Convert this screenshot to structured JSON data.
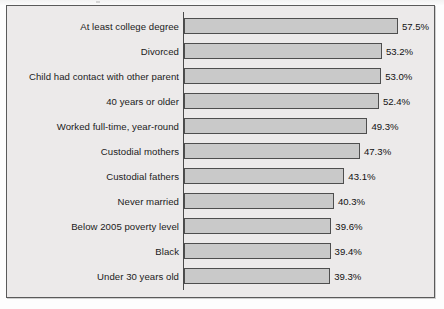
{
  "chart_data": {
    "type": "bar",
    "orientation": "horizontal",
    "title": "",
    "subtitle": "",
    "xlabel": "",
    "ylabel": "",
    "grid": false,
    "legend": false,
    "legend_position": "none",
    "xlim": [
      0,
      60
    ],
    "value_suffix": "%",
    "categories": [
      "At least college degree",
      "Divorced",
      "Child had contact with other parent",
      "40 years or older",
      "Worked full-time, year-round",
      "Custodial mothers",
      "Custodial fathers",
      "Never married",
      "Below 2005 poverty level",
      "Black",
      "Under 30 years old"
    ],
    "values": [
      57.5,
      53.2,
      53.0,
      52.4,
      49.3,
      47.3,
      43.1,
      40.3,
      39.6,
      39.4,
      39.3
    ],
    "value_labels": [
      "57.5%",
      "53.2%",
      "53.0%",
      "52.4%",
      "49.3%",
      "47.3%",
      "43.1%",
      "40.3%",
      "39.6%",
      "39.4%",
      "39.3%"
    ],
    "colors": {
      "bar_fill": "#c9c9c9",
      "bar_border": "#4e4e4e",
      "plot_background": "#eceaea",
      "frame_border": "#5a5a5a",
      "axis": "#4a4a4a",
      "text": "#1b1b1b"
    }
  }
}
